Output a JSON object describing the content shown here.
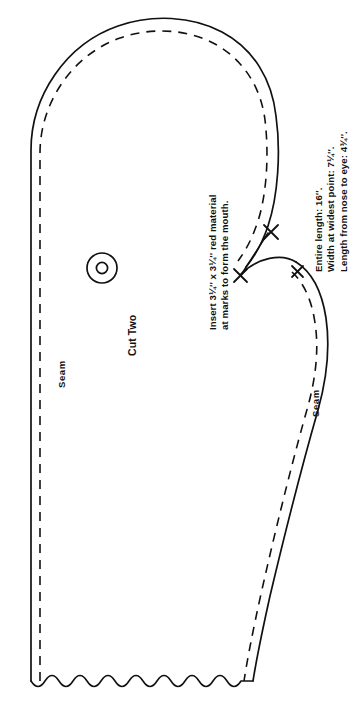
{
  "document": {
    "kind": "sewing-pattern-piece",
    "ink_color": "#111111",
    "paper_color": "#ffffff"
  },
  "labels": {
    "cut_two": "Cut Two",
    "seam_left": "Seam",
    "seam_right": "Seam",
    "insert_line1": "Insert 3¼′′ x 3¼′′ red material",
    "insert_line2": "at marks to form the mouth."
  },
  "dimensions": {
    "line1": "Entire length: 16′′.",
    "line2": "Width at widest point: 7¼′′.",
    "line3": "Length from nose to eye: 4¾′′."
  },
  "marks": {
    "eye": "eye-placement-circle",
    "mouth_mark_upper": "x-mark",
    "mouth_mark_lower": "x-mark"
  },
  "lines": {
    "cutting_line": "solid outer cutting line",
    "seam_line": "dashed inner seam allowance line",
    "bottom_edge": "scalloped wavy open edge"
  }
}
